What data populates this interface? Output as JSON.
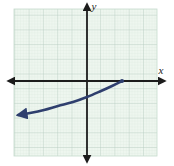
{
  "figure": {
    "type": "coordinate-plane-graph",
    "background_color": "#ffffff",
    "grid": {
      "fill_color": "#eef6ef",
      "minor_line_color": "#d7e8dc",
      "major_line_color": "#b9cfc2",
      "left_px": 14,
      "top_px": 9,
      "right_px": 157,
      "bottom_px": 156,
      "major_spacing_px": 14.3,
      "minor_per_major": 5,
      "columns": 10,
      "rows": 10,
      "visible": true
    },
    "axes": {
      "color": "#1c1c1c",
      "x_axis": {
        "label": "x",
        "label_x_px": 161,
        "label_y_px": 74,
        "y_px": 81,
        "arrow_left": true,
        "arrow_right": true,
        "start_px": 7,
        "end_px": 166
      },
      "y_axis": {
        "label": "y",
        "label_x_px": 94,
        "label_y_px": 10,
        "x_px": 87,
        "arrow_up": true,
        "arrow_down": true,
        "start_px": 3,
        "end_px": 163
      }
    }
  },
  "chart_data": {
    "type": "line",
    "title": "",
    "xlabel": "x",
    "ylabel": "y",
    "grid": true,
    "legend": null,
    "xlim": [
      -5,
      5
    ],
    "ylim": [
      -5,
      5
    ],
    "series": [
      {
        "name": "increasing concave-up curve",
        "color": "#2f3f6e",
        "line_width": 2.6,
        "start_arrow": true,
        "end_arrow": false,
        "end_point_marker": true,
        "description": "Exponential-type curve rising from lower-left toward an endpoint on the positive x-axis",
        "x": [
          -4.8,
          -4.0,
          -3.0,
          -2.0,
          -1.0,
          0.0,
          1.0,
          1.7,
          2.4
        ],
        "y": [
          -2.35,
          -2.2,
          -2.0,
          -1.75,
          -1.45,
          -1.1,
          -0.7,
          -0.35,
          0.0
        ],
        "points_px": [
          [
            18,
            115
          ],
          [
            30,
            113
          ],
          [
            44,
            110
          ],
          [
            58,
            106
          ],
          [
            73,
            102
          ],
          [
            87,
            97
          ],
          [
            101,
            91
          ],
          [
            112,
            86
          ],
          [
            122,
            81
          ]
        ]
      }
    ]
  }
}
